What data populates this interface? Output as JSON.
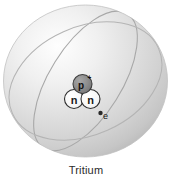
{
  "figure": {
    "caption": "Tritium",
    "title": "Tritium",
    "alt": "Tritium atom model"
  },
  "atom": {
    "element_name": "Tritium",
    "nucleus": {
      "proton": {
        "label": "p",
        "charge": "+",
        "full_label": "p+",
        "count": 1,
        "fill_color": "#8e8e8e",
        "stroke_color": "#3d3d3d"
      },
      "neutrons": [
        {
          "label": "n",
          "fill_color": "#fbfbfb",
          "stroke_color": "#2e2e2e"
        },
        {
          "label": "n",
          "fill_color": "#fbfbfb",
          "stroke_color": "#2e2e2e"
        }
      ],
      "neutron_count": 2
    },
    "electron": {
      "label": "e",
      "count": 1,
      "dot_color": "#2a2a2a"
    },
    "shell": {
      "label": "electron-shell",
      "sphere_color_light": "#fdfdfd",
      "sphere_color_mid": "#d8d8d8",
      "sphere_color_dark": "#bdbdbd",
      "orbit_line_color": "#a0a0a0"
    }
  },
  "colors": {
    "background": "#ffffff",
    "caption": "#2b2b2b",
    "proton_fill": "#8e8e8e",
    "neutron_fill": "#fbfbfb",
    "sphere_edge": "#c2c2c2"
  }
}
